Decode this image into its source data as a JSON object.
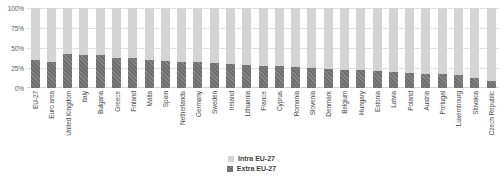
{
  "chart_data": {
    "type": "bar",
    "subtype": "stacked-100-percent",
    "title": "",
    "subtitle": "",
    "xlabel": "",
    "ylabel": "",
    "ylim": [
      0,
      100
    ],
    "yticks": [
      "0%",
      "25%",
      "50%",
      "75%",
      "100%"
    ],
    "ytick_values": [
      0,
      25,
      50,
      75,
      100
    ],
    "grid": true,
    "legend_position": "bottom-center",
    "categories": [
      "EU-27",
      "Euro area",
      "United Kingdom",
      "Italy",
      "Bulgaria",
      "Greece",
      "Finland",
      "Malta",
      "Spain",
      "Netherlands",
      "Germany",
      "Sweden",
      "Ireland",
      "Lithuania",
      "France",
      "Cyprus",
      "Romania",
      "Slovenia",
      "Denmark",
      "Belgium",
      "Hungary",
      "Estonia",
      "Latvia",
      "Poland",
      "Austria",
      "Portugal",
      "Luxembourg",
      "Slovakia",
      "Czech Republic"
    ],
    "series": [
      {
        "name": "Extra EU-27",
        "color": "#6e6e6e",
        "hatched": true,
        "values": [
          35,
          33,
          43,
          41,
          41,
          38,
          37,
          35,
          34,
          33,
          32,
          31,
          30,
          29,
          28,
          27,
          26,
          25,
          24,
          23,
          22,
          21,
          20,
          19,
          18,
          17,
          16,
          12,
          9
        ]
      },
      {
        "name": "Intra EU-27",
        "color": "#d4d4d4",
        "hatched": false,
        "values": [
          65,
          67,
          57,
          59,
          59,
          62,
          63,
          65,
          66,
          67,
          68,
          69,
          70,
          71,
          72,
          73,
          74,
          75,
          76,
          77,
          78,
          79,
          80,
          81,
          82,
          83,
          84,
          88,
          91
        ]
      }
    ],
    "stack_order_bottom_to_top": [
      "Extra EU-27",
      "Intra EU-27"
    ]
  },
  "legend": {
    "items": [
      {
        "label": "Intra EU-27",
        "swatch": "intra"
      },
      {
        "label": "Extra EU-27",
        "swatch": "extra"
      }
    ]
  }
}
